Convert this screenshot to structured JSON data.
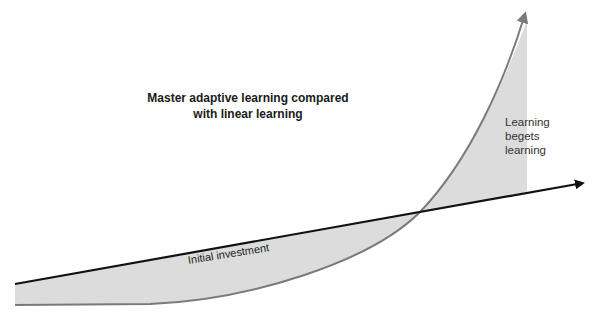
{
  "diagram": {
    "title_line1": "Master adaptive learning compared",
    "title_line2": "with linear learning",
    "labels": {
      "right_line1": "Learning",
      "right_line2": "begets",
      "right_line3": "learning",
      "initial": "Initial investment"
    },
    "colors": {
      "fill": "#dcdcdc",
      "curve": "#7a7a7a",
      "linear": "#111111",
      "text": "#222222"
    },
    "series": [
      {
        "name": "Linear learning",
        "style": "black straight arrow",
        "start": [
          15,
          284
        ],
        "end": [
          585,
          183
        ]
      },
      {
        "name": "Master adaptive learning",
        "style": "gray exponential arrow",
        "start": [
          15,
          305
        ],
        "end": [
          525,
          12
        ]
      }
    ],
    "crossover_point": [
      420,
      212
    ]
  }
}
